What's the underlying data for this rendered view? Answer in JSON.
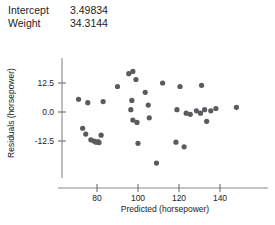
{
  "params": {
    "rows": [
      {
        "name": "Intercept",
        "value": "3.49834"
      },
      {
        "name": "Weight",
        "value": "34.3144"
      }
    ]
  },
  "chart_data": {
    "type": "scatter",
    "title": "",
    "xlabel": "Predicted (horsepower)",
    "ylabel": "Residuals (horsepower)",
    "xlim": [
      68,
      152
    ],
    "ylim": [
      -24,
      18
    ],
    "xticks": [
      80,
      100,
      120,
      140
    ],
    "xticklabels": [
      "80",
      "100",
      "120",
      "140"
    ],
    "yticks": [
      12.5,
      0.0,
      -12.5
    ],
    "yticklabels": [
      "12.5",
      "0.0",
      "-12.5"
    ],
    "grid": false,
    "legend": null,
    "marker": {
      "shape": "circle",
      "size": 2.6,
      "color": "#5a5a5f"
    },
    "points": [
      {
        "x": 71.0,
        "y": 5.5
      },
      {
        "x": 73.0,
        "y": -7.0
      },
      {
        "x": 74.5,
        "y": -9.5
      },
      {
        "x": 77.0,
        "y": -12.0
      },
      {
        "x": 78.5,
        "y": -12.5
      },
      {
        "x": 79.5,
        "y": -13.0
      },
      {
        "x": 80.5,
        "y": -12.8
      },
      {
        "x": 81.0,
        "y": -13.2
      },
      {
        "x": 82.0,
        "y": -10.0
      },
      {
        "x": 75.5,
        "y": 4.0
      },
      {
        "x": 83.0,
        "y": 4.5
      },
      {
        "x": 90.0,
        "y": 11.0
      },
      {
        "x": 95.5,
        "y": 16.5
      },
      {
        "x": 97.5,
        "y": 17.5
      },
      {
        "x": 99.0,
        "y": 14.0
      },
      {
        "x": 97.0,
        "y": 5.0
      },
      {
        "x": 96.5,
        "y": 1.0
      },
      {
        "x": 97.5,
        "y": -3.5
      },
      {
        "x": 99.5,
        "y": -4.5
      },
      {
        "x": 103.5,
        "y": 8.5
      },
      {
        "x": 105.0,
        "y": 3.0
      },
      {
        "x": 105.5,
        "y": -2.5
      },
      {
        "x": 100.0,
        "y": -13.5
      },
      {
        "x": 109.0,
        "y": -22.0
      },
      {
        "x": 112.0,
        "y": 12.5
      },
      {
        "x": 120.5,
        "y": 11.0
      },
      {
        "x": 119.0,
        "y": 1.0
      },
      {
        "x": 118.5,
        "y": -13.0
      },
      {
        "x": 123.5,
        "y": -0.5
      },
      {
        "x": 125.5,
        "y": -1.0
      },
      {
        "x": 122.5,
        "y": -15.0
      },
      {
        "x": 128.5,
        "y": 0.5
      },
      {
        "x": 131.0,
        "y": 11.5
      },
      {
        "x": 130.5,
        "y": -0.5
      },
      {
        "x": 132.5,
        "y": 1.0
      },
      {
        "x": 133.5,
        "y": -4.0
      },
      {
        "x": 135.5,
        "y": 0.5
      },
      {
        "x": 138.0,
        "y": 1.5
      },
      {
        "x": 148.0,
        "y": 2.0
      }
    ]
  }
}
